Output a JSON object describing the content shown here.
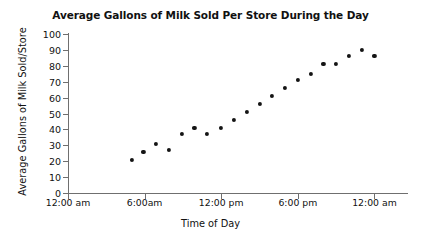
{
  "chart_data": {
    "type": "scatter",
    "title": "Average Gallons of Milk Sold Per Store During the Day",
    "xlabel": "Time of Day",
    "ylabel": "Average Gallons of Milk Sold/Store",
    "grid": false,
    "legend": null,
    "xlim": [
      0,
      26
    ],
    "ylim": [
      0,
      100
    ],
    "x_tick_values": [
      0,
      6,
      12,
      18,
      24
    ],
    "x_tick_labels": [
      "12:00 am",
      "6:00am",
      "12:00 pm",
      "6:00 pm",
      "12:00 am"
    ],
    "y_tick_labels": [
      "0",
      "10",
      "20",
      "30",
      "40",
      "50",
      "60",
      "70",
      "80",
      "90",
      "100"
    ],
    "y_tick_values": [
      0,
      10,
      20,
      30,
      40,
      50,
      60,
      70,
      80,
      90,
      100
    ],
    "x_unit": "hours since 12:00 am",
    "y_unit": "gallons",
    "points": [
      {
        "x": 5.0,
        "y": 21
      },
      {
        "x": 5.9,
        "y": 26
      },
      {
        "x": 6.9,
        "y": 31
      },
      {
        "x": 7.9,
        "y": 27
      },
      {
        "x": 8.9,
        "y": 37
      },
      {
        "x": 9.9,
        "y": 41
      },
      {
        "x": 10.9,
        "y": 37
      },
      {
        "x": 12.0,
        "y": 41
      },
      {
        "x": 13.0,
        "y": 46
      },
      {
        "x": 14.0,
        "y": 51
      },
      {
        "x": 15.0,
        "y": 56
      },
      {
        "x": 16.0,
        "y": 61
      },
      {
        "x": 17.0,
        "y": 66
      },
      {
        "x": 18.0,
        "y": 71
      },
      {
        "x": 19.0,
        "y": 75
      },
      {
        "x": 20.0,
        "y": 81
      },
      {
        "x": 21.0,
        "y": 81
      },
      {
        "x": 22.0,
        "y": 86
      },
      {
        "x": 23.0,
        "y": 90
      },
      {
        "x": 24.0,
        "y": 86
      }
    ],
    "marker_color": "#141414",
    "axis_color": "#6f6f6f"
  }
}
